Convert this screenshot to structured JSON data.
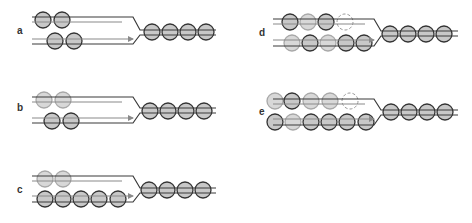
{
  "colors": {
    "dark_line": "#3a3a3a",
    "gray_line": "#8a8a8a",
    "fill_gray": "#c8c8c8",
    "fill_light": "#d8d8d8",
    "stroke_dark": "#333333",
    "stroke_light": "#a8a8a8",
    "dashed": "#999999"
  },
  "panels": [
    {
      "id": "a",
      "label": "a",
      "label_pos": [
        17,
        34
      ],
      "left_x": 32,
      "top": {
        "dark_y": 17,
        "gray_y": 22,
        "gray_end": 122,
        "dark_end": 133
      },
      "bottom": {
        "gray_y": 39,
        "dark_y": 44,
        "gray_end": 133,
        "dark_end": 133,
        "arrow": true
      },
      "merge_x": 140,
      "right": {
        "y1": 30,
        "y2": 35,
        "end": 216
      },
      "top_circles": [
        {
          "x": 43,
          "y": 20,
          "style": "dark"
        },
        {
          "x": 62,
          "y": 20,
          "style": "dark"
        }
      ],
      "bottom_circles": [
        {
          "x": 55,
          "y": 41,
          "style": "dark"
        },
        {
          "x": 74,
          "y": 41,
          "style": "dark"
        }
      ],
      "right_circles": [
        {
          "x": 152,
          "y": 32
        },
        {
          "x": 170,
          "y": 32
        },
        {
          "x": 188,
          "y": 32
        },
        {
          "x": 206,
          "y": 32
        }
      ]
    },
    {
      "id": "b",
      "label": "b",
      "label_pos": [
        17,
        111
      ],
      "left_x": 32,
      "top": {
        "dark_y": 97,
        "gray_y": 102,
        "gray_end": 122,
        "dark_end": 133
      },
      "bottom": {
        "gray_y": 118,
        "dark_y": 123,
        "gray_end": 133,
        "dark_end": 133,
        "arrow": true
      },
      "merge_x": 140,
      "right": {
        "y1": 108,
        "y2": 113,
        "end": 216
      },
      "top_circles": [
        {
          "x": 44,
          "y": 100,
          "style": "light"
        },
        {
          "x": 63,
          "y": 100,
          "style": "light"
        }
      ],
      "bottom_circles": [
        {
          "x": 52,
          "y": 121,
          "style": "dark"
        },
        {
          "x": 71,
          "y": 121,
          "style": "dark"
        }
      ],
      "right_circles": [
        {
          "x": 150,
          "y": 111
        },
        {
          "x": 168,
          "y": 111
        },
        {
          "x": 186,
          "y": 111
        },
        {
          "x": 204,
          "y": 111
        }
      ]
    },
    {
      "id": "c",
      "label": "c",
      "label_pos": [
        17,
        193
      ],
      "left_x": 32,
      "top": {
        "dark_y": 176,
        "gray_y": 181,
        "gray_end": 122,
        "dark_end": 133
      },
      "bottom": {
        "gray_y": 196,
        "dark_y": 202,
        "gray_end": 133,
        "dark_end": 133,
        "arrow": true
      },
      "merge_x": 140,
      "right": {
        "y1": 188,
        "y2": 193,
        "end": 216
      },
      "top_circles": [
        {
          "x": 45,
          "y": 179,
          "style": "light"
        },
        {
          "x": 63,
          "y": 179,
          "style": "light"
        }
      ],
      "bottom_circles": [
        {
          "x": 45,
          "y": 199,
          "style": "dark"
        },
        {
          "x": 63,
          "y": 199,
          "style": "dark"
        },
        {
          "x": 81,
          "y": 199,
          "style": "dark"
        },
        {
          "x": 99,
          "y": 199,
          "style": "dark"
        },
        {
          "x": 118,
          "y": 199,
          "style": "dark"
        }
      ],
      "right_circles": [
        {
          "x": 149,
          "y": 190
        },
        {
          "x": 167,
          "y": 190
        },
        {
          "x": 185,
          "y": 190
        },
        {
          "x": 203,
          "y": 190
        }
      ]
    },
    {
      "id": "d",
      "label": "d",
      "label_pos": [
        259,
        36
      ],
      "left_x": 273,
      "top": {
        "dark_y": 19,
        "gray_y": 24,
        "gray_end": 365,
        "dark_end": 374
      },
      "bottom": {
        "gray_y": 40,
        "dark_y": 46,
        "gray_end": 374,
        "dark_end": 374,
        "arrow": true
      },
      "merge_x": 381,
      "right": {
        "y1": 31,
        "y2": 36,
        "end": 458
      },
      "top_circles": [
        {
          "x": 290,
          "y": 22,
          "style": "dark"
        },
        {
          "x": 308,
          "y": 22,
          "style": "light"
        },
        {
          "x": 326,
          "y": 22,
          "style": "dark"
        },
        {
          "x": 345,
          "y": 22,
          "style": "dashed"
        }
      ],
      "bottom_circles": [
        {
          "x": 292,
          "y": 43,
          "style": "light"
        },
        {
          "x": 310,
          "y": 43,
          "style": "dark"
        },
        {
          "x": 328,
          "y": 43,
          "style": "light"
        },
        {
          "x": 346,
          "y": 43,
          "style": "dark"
        },
        {
          "x": 364,
          "y": 43,
          "style": "dark"
        }
      ],
      "right_circles": [
        {
          "x": 390,
          "y": 34
        },
        {
          "x": 408,
          "y": 34
        },
        {
          "x": 426,
          "y": 34
        },
        {
          "x": 444,
          "y": 34
        }
      ]
    },
    {
      "id": "e",
      "label": "e",
      "label_pos": [
        259,
        115
      ],
      "left_x": 273,
      "top": {
        "dark_y": 99,
        "gray_y": 104,
        "gray_end": 365,
        "dark_end": 374
      },
      "bottom": {
        "gray_y": 119,
        "dark_y": 125,
        "gray_end": 374,
        "dark_end": 374,
        "arrow": true
      },
      "merge_x": 381,
      "right": {
        "y1": 110,
        "y2": 115,
        "end": 458
      },
      "top_circles": [
        {
          "x": 275,
          "y": 101,
          "style": "light"
        },
        {
          "x": 292,
          "y": 101,
          "style": "dark"
        },
        {
          "x": 311,
          "y": 101,
          "style": "light"
        },
        {
          "x": 330,
          "y": 101,
          "style": "light"
        },
        {
          "x": 350,
          "y": 101,
          "style": "dashed"
        }
      ],
      "bottom_circles": [
        {
          "x": 275,
          "y": 122,
          "style": "dark"
        },
        {
          "x": 293,
          "y": 122,
          "style": "light"
        },
        {
          "x": 311,
          "y": 122,
          "style": "dark"
        },
        {
          "x": 329,
          "y": 122,
          "style": "dark"
        },
        {
          "x": 347,
          "y": 122,
          "style": "dark"
        },
        {
          "x": 366,
          "y": 122,
          "style": "dark"
        }
      ],
      "right_circles": [
        {
          "x": 391,
          "y": 112
        },
        {
          "x": 409,
          "y": 112
        },
        {
          "x": 427,
          "y": 112
        },
        {
          "x": 445,
          "y": 112
        }
      ]
    }
  ],
  "circle_radius": 8
}
